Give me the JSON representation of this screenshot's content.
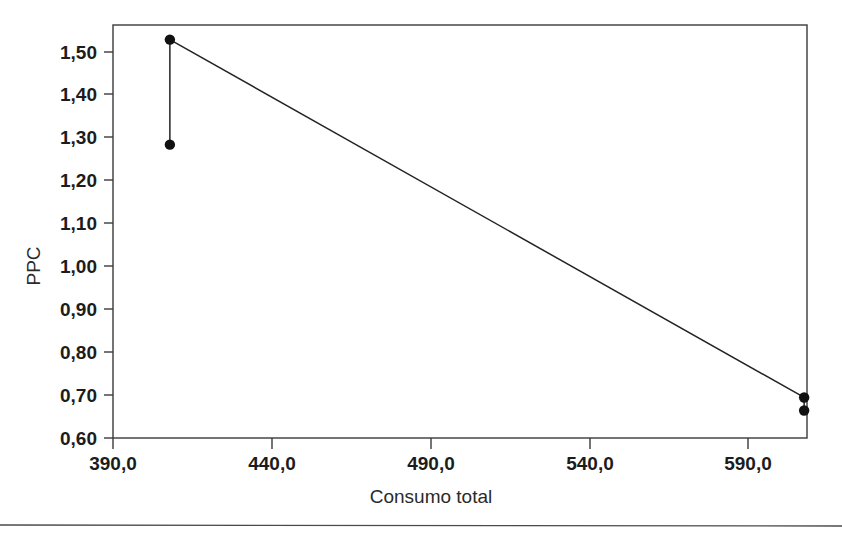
{
  "figure": {
    "background_color": "#ffffff",
    "ink_color": "#1c1c1c",
    "page_rule_label": "page-bottom-rule"
  },
  "chart_data": {
    "type": "scatter",
    "title": "",
    "subtitle": "",
    "xlabel": "Consumo total",
    "ylabel": "PPC",
    "xlim": [
      381.5,
      599.9
    ],
    "ylim": [
      0.6,
      1.5475
    ],
    "grid": false,
    "legend": null,
    "legend_position": "none",
    "decimal_separator": ",",
    "x_ticks": [
      390.0,
      440.0,
      490.0,
      540.0,
      590.0
    ],
    "x_tick_labels": [
      "390,0",
      "440,0",
      "490,0",
      "540,0",
      "590,0"
    ],
    "y_ticks": [
      0.6,
      0.7,
      0.8,
      0.9,
      1.0,
      1.1,
      1.2,
      1.3,
      1.4,
      1.5
    ],
    "y_tick_labels": [
      "0,60",
      "0,70",
      "0,80",
      "0,90",
      "1,00",
      "1,10",
      "1,20",
      "1,30",
      "1,40",
      "1,50"
    ],
    "points": [
      {
        "name": "point-upper-left",
        "x": 399.4,
        "y": 1.514
      },
      {
        "name": "point-lower-left",
        "x": 399.4,
        "y": 1.273
      },
      {
        "name": "point-upper-right",
        "x": 599.0,
        "y": 0.693
      },
      {
        "name": "point-lower-right",
        "x": 599.0,
        "y": 0.663
      }
    ],
    "segments": [
      {
        "name": "segment-left-vertical",
        "x1": 399.4,
        "y1": 1.514,
        "x2": 399.4,
        "y2": 1.273
      },
      {
        "name": "segment-diagonal",
        "x1": 399.4,
        "y1": 1.514,
        "x2": 599.0,
        "y2": 0.693
      },
      {
        "name": "segment-right-vertical",
        "x1": 599.0,
        "y1": 0.693,
        "x2": 599.0,
        "y2": 0.663
      }
    ],
    "annotations": []
  },
  "axis": {
    "x_title": "Consumo total",
    "y_title": "PPC"
  },
  "ticks": {
    "x": [
      "390,0",
      "440,0",
      "490,0",
      "540,0",
      "590,0"
    ],
    "y": [
      "1,50",
      "1,40",
      "1,30",
      "1,20",
      "1,10",
      "1,00",
      "0,90",
      "0,80",
      "0,70",
      "0,60"
    ]
  }
}
